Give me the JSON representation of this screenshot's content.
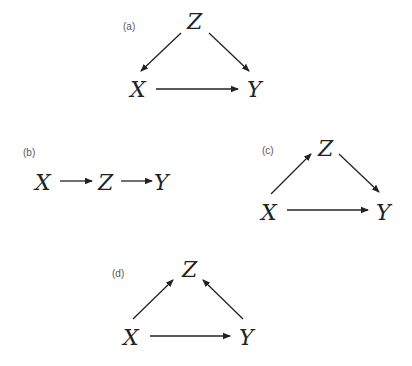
{
  "figure": {
    "panels": [
      {
        "id": "a",
        "label": "(a)",
        "nodes": {
          "z": "Z",
          "x": "X",
          "y": "Y"
        },
        "edges": [
          {
            "from": "Z",
            "to": "X"
          },
          {
            "from": "Z",
            "to": "Y"
          },
          {
            "from": "X",
            "to": "Y"
          }
        ]
      },
      {
        "id": "b",
        "label": "(b)",
        "nodes": {
          "x": "X",
          "z": "Z",
          "y": "Y"
        },
        "edges": [
          {
            "from": "X",
            "to": "Z"
          },
          {
            "from": "Z",
            "to": "Y"
          }
        ]
      },
      {
        "id": "c",
        "label": "(c)",
        "nodes": {
          "z": "Z",
          "x": "X",
          "y": "Y"
        },
        "edges": [
          {
            "from": "X",
            "to": "Z"
          },
          {
            "from": "Z",
            "to": "Y"
          },
          {
            "from": "X",
            "to": "Y"
          }
        ]
      },
      {
        "id": "d",
        "label": "(d)",
        "nodes": {
          "z": "Z",
          "x": "X",
          "y": "Y"
        },
        "edges": [
          {
            "from": "X",
            "to": "Z"
          },
          {
            "from": "Y",
            "to": "Z"
          },
          {
            "from": "X",
            "to": "Y"
          }
        ]
      }
    ],
    "colors": {
      "text": "#222222",
      "label": "#555555",
      "background": "#ffffff"
    }
  }
}
